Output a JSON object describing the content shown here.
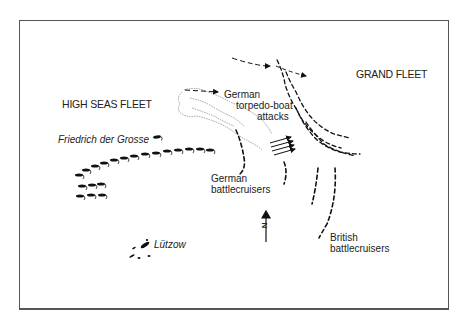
{
  "diagram": {
    "type": "naval battle map",
    "labels": {
      "high_seas_fleet": "HIGH SEAS FLEET",
      "grand_fleet": "GRAND FLEET",
      "friedrich": "Friedrich der Grosse",
      "torpedo_line1": "German",
      "torpedo_line2": "torpedo-boat",
      "torpedo_line3": "attacks",
      "german_bc_line1": "German",
      "german_bc_line2": "battlecruisers",
      "british_bc_line1": "British",
      "british_bc_line2": "battlecruisers",
      "lutzow": "Lützow",
      "north": "N"
    },
    "colors": {
      "ink": "#111111",
      "frame": "#555555",
      "smoke": "#888888",
      "background": "#ffffff"
    }
  }
}
